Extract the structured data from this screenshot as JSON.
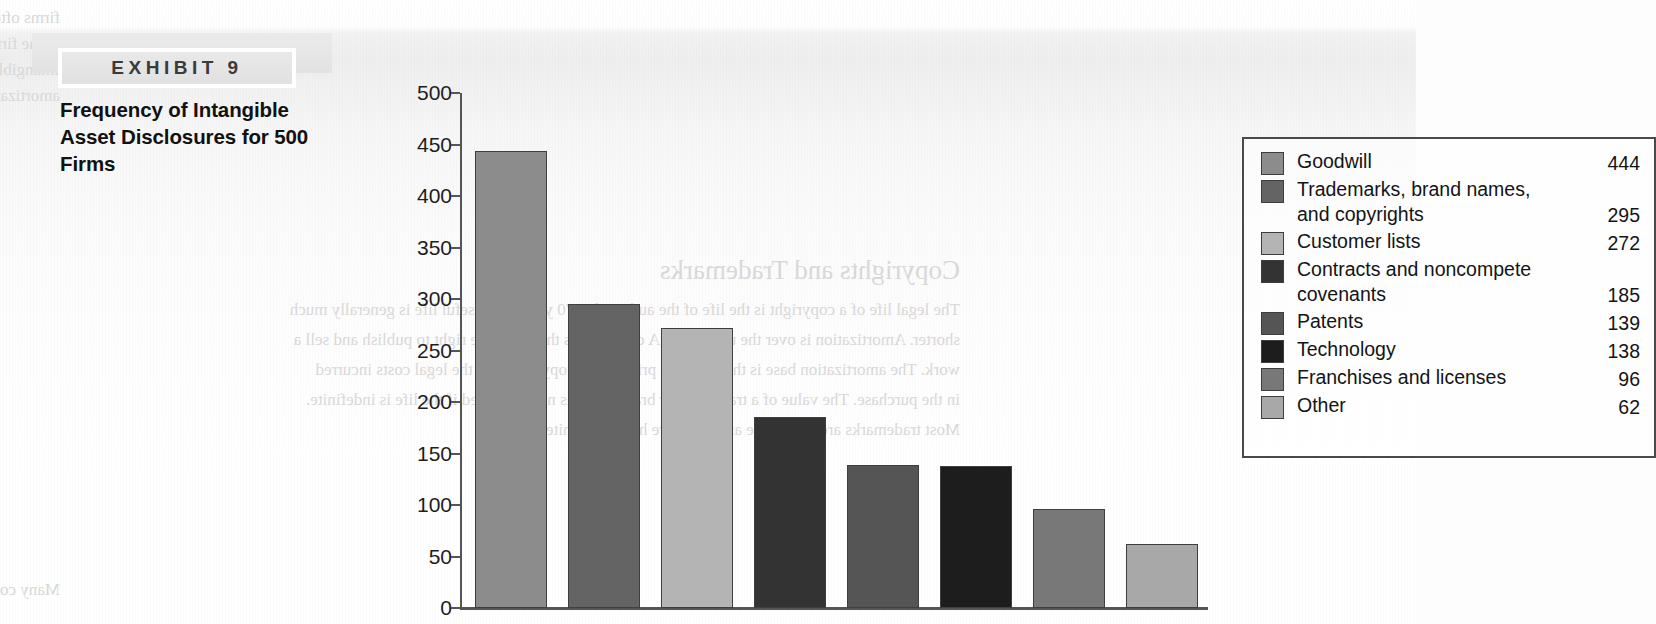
{
  "exhibit": {
    "tag": "EXHIBIT 9",
    "title": "Frequency of Intangible Asset Disclosures for 500 Firms"
  },
  "background_ghost_text": [
    "firms often begin research and development costs for 2000. If a group of the pool applies to these items",
    "to the firms with an ending life of more than 500 cells.",
    "Intangible benefits research and development costs and assets expenses from the company",
    "amortization account of purchase intangible assets.",
    "Copyrights and Trademarks",
    "The legal life of a copyright is the life of the author plus 70 years; the useful life is generally much",
    "shorter. Amortization is over the useful life. A copyright is the exclusive right to publish and sell a",
    "work. The amortization base is the purchase price of the copyright plus the legal costs incurred",
    "in the purchase. The value of a trademark or brand name is not amortized if the life is indefinite.",
    "Most trademarks are renewable and therefore have indefinite lives.",
    "Many companies have disclosed their intangible assets in their notes to the financial statements."
  ],
  "chart_data": {
    "type": "bar",
    "title": "Frequency of Intangible Asset Disclosures for 500 Firms",
    "xlabel": "",
    "ylabel": "",
    "ylim": [
      0,
      500
    ],
    "y_ticks": [
      "0",
      "50",
      "100",
      "150",
      "200",
      "250",
      "300",
      "350",
      "400",
      "450",
      "500"
    ],
    "grid": false,
    "legend_position": "top-right",
    "categories": [
      "Goodwill",
      "Trademarks, brand names, and copyrights",
      "Customer lists",
      "Contracts and noncompete covenants",
      "Patents",
      "Technology",
      "Franchises and licenses",
      "Other"
    ],
    "values": [
      444,
      295,
      272,
      185,
      139,
      138,
      96,
      62
    ],
    "colors": [
      "#8c8c8c",
      "#646464",
      "#b4b4b4",
      "#333333",
      "#555555",
      "#1d1d1d",
      "#787878",
      "#a8a8a8"
    ]
  },
  "legend": {
    "items": [
      {
        "label_line1": "Goodwill",
        "label_line2": "",
        "value": "444",
        "color": "#8c8c8c"
      },
      {
        "label_line1": "Trademarks, brand names,",
        "label_line2": "and copyrights",
        "value": "295",
        "color": "#646464"
      },
      {
        "label_line1": "Customer lists",
        "label_line2": "",
        "value": "272",
        "color": "#b4b4b4"
      },
      {
        "label_line1": "Contracts and noncompete",
        "label_line2": "covenants",
        "value": "185",
        "color": "#333333"
      },
      {
        "label_line1": "Patents",
        "label_line2": "",
        "value": "139",
        "color": "#555555"
      },
      {
        "label_line1": "Technology",
        "label_line2": "",
        "value": "138",
        "color": "#1d1d1d"
      },
      {
        "label_line1": "Franchises and licenses",
        "label_line2": "",
        "value": "96",
        "color": "#787878"
      },
      {
        "label_line1": "Other",
        "label_line2": "",
        "value": "62",
        "color": "#a8a8a8"
      }
    ]
  }
}
